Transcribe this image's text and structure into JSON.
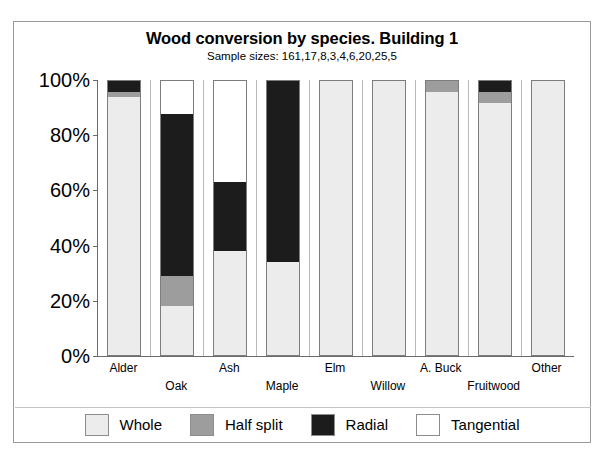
{
  "chart_data": {
    "type": "bar",
    "subtype": "stacked-percent",
    "title": "Wood conversion by species. Building 1",
    "subtitle": "Sample sizes: 161,17,8,3,4,6,20,25,5",
    "xlabel": "",
    "ylabel": "",
    "ylim": [
      0,
      100
    ],
    "yticks": [
      0,
      20,
      40,
      60,
      80,
      100
    ],
    "ytick_labels": [
      "0%",
      "20%",
      "40%",
      "60%",
      "80%",
      "100%"
    ],
    "grid": false,
    "legend_position": "bottom",
    "categories": [
      "Alder",
      "Oak",
      "Ash",
      "Maple",
      "Elm",
      "Willow",
      "A. Buck",
      "Fruitwood",
      "Other"
    ],
    "sample_sizes": [
      161,
      17,
      8,
      3,
      4,
      6,
      20,
      25,
      5
    ],
    "series": [
      {
        "name": "Whole",
        "color": "#ececec",
        "values": [
          94,
          18,
          38,
          34,
          100,
          100,
          96,
          92,
          100
        ]
      },
      {
        "name": "Half split",
        "color": "#9d9d9d",
        "values": [
          2,
          11,
          0,
          0,
          0,
          0,
          4,
          4,
          0
        ]
      },
      {
        "name": "Radial",
        "color": "#1c1c1c",
        "values": [
          4,
          59,
          25,
          66,
          0,
          0,
          0,
          4,
          0
        ]
      },
      {
        "name": "Tangential",
        "color": "#ffffff",
        "values": [
          0,
          12,
          37,
          0,
          0,
          0,
          0,
          0,
          0
        ]
      }
    ],
    "x_label_rows": [
      0,
      1,
      0,
      1,
      0,
      1,
      0,
      1,
      0
    ]
  }
}
